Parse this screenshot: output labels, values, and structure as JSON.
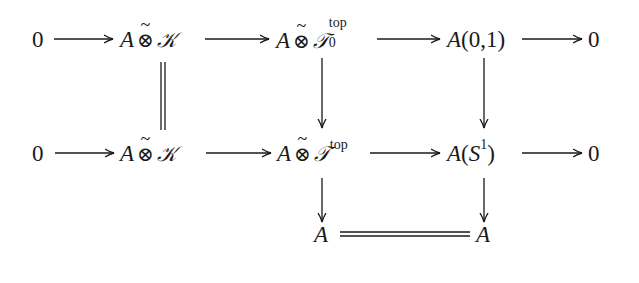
{
  "diagram": {
    "type": "commutative-diagram",
    "rows": [
      {
        "nodes": [
          {
            "id": "r1_zero_left",
            "label": "0"
          },
          {
            "id": "r1_a_tensor_k",
            "label": "A ⊗̃ 𝒦",
            "parts": {
              "base": "A",
              "op": "⊗",
              "accent": "~",
              "rhs": "𝒦"
            }
          },
          {
            "id": "r1_a_tensor_t0top",
            "label": "A ⊗̃ 𝒯₀^top",
            "parts": {
              "base": "A",
              "op": "⊗",
              "accent": "~",
              "rhs": "𝒯",
              "sup": "top",
              "sub": "0"
            }
          },
          {
            "id": "r1_a01",
            "label": "A(0,1)",
            "parts": {
              "base": "A",
              "args": "(0,1)"
            }
          },
          {
            "id": "r1_zero_right",
            "label": "0"
          }
        ]
      },
      {
        "nodes": [
          {
            "id": "r2_zero_left",
            "label": "0"
          },
          {
            "id": "r2_a_tensor_k",
            "label": "A ⊗̃ 𝒦",
            "parts": {
              "base": "A",
              "op": "⊗",
              "accent": "~",
              "rhs": "𝒦"
            }
          },
          {
            "id": "r2_a_tensor_ttop",
            "label": "A ⊗̃ 𝒯^top",
            "parts": {
              "base": "A",
              "op": "⊗",
              "accent": "~",
              "rhs": "𝒯",
              "sup": "top"
            }
          },
          {
            "id": "r2_as1",
            "label": "A(S¹)",
            "parts": {
              "base": "A",
              "open": "(",
              "arg": "S",
              "sup": "1",
              "close": ")"
            }
          },
          {
            "id": "r2_zero_right",
            "label": "0"
          }
        ]
      },
      {
        "nodes": [
          {
            "id": "r3_a_left",
            "label": "A"
          },
          {
            "id": "r3_a_right",
            "label": "A"
          }
        ]
      }
    ],
    "edges": [
      {
        "from": "r1_zero_left",
        "to": "r1_a_tensor_k",
        "style": "arrow"
      },
      {
        "from": "r1_a_tensor_k",
        "to": "r1_a_tensor_t0top",
        "style": "arrow"
      },
      {
        "from": "r1_a_tensor_t0top",
        "to": "r1_a01",
        "style": "arrow"
      },
      {
        "from": "r1_a01",
        "to": "r1_zero_right",
        "style": "arrow"
      },
      {
        "from": "r2_zero_left",
        "to": "r2_a_tensor_k",
        "style": "arrow"
      },
      {
        "from": "r2_a_tensor_k",
        "to": "r2_a_tensor_ttop",
        "style": "arrow"
      },
      {
        "from": "r2_a_tensor_ttop",
        "to": "r2_as1",
        "style": "arrow"
      },
      {
        "from": "r2_as1",
        "to": "r2_zero_right",
        "style": "arrow"
      },
      {
        "from": "r1_a_tensor_k",
        "to": "r2_a_tensor_k",
        "style": "equality"
      },
      {
        "from": "r1_a_tensor_t0top",
        "to": "r2_a_tensor_ttop",
        "style": "arrow"
      },
      {
        "from": "r1_a01",
        "to": "r2_as1",
        "style": "arrow"
      },
      {
        "from": "r2_a_tensor_ttop",
        "to": "r3_a_left",
        "style": "arrow"
      },
      {
        "from": "r2_as1",
        "to": "r3_a_right",
        "style": "arrow"
      },
      {
        "from": "r3_a_left",
        "to": "r3_a_right",
        "style": "equality"
      }
    ]
  },
  "text": {
    "zero": "0",
    "A": "A",
    "otimes": "⊗",
    "tilde": "~",
    "K": "𝒦",
    "T": "𝒯",
    "top": "top",
    "sub0": "0",
    "a01": "A(0,1)",
    "S": "S",
    "one": "1",
    "lparen": "(",
    "rparen": ")"
  },
  "colors": {
    "ink": "#1a1a1a",
    "background": "#ffffff"
  }
}
